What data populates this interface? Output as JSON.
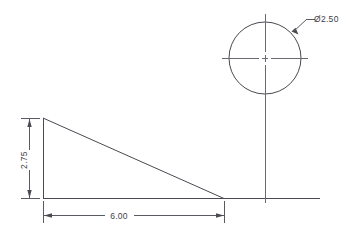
{
  "drawing": {
    "background_color": "#ffffff",
    "line_color": "#4a4a52",
    "dim_color": "#5a5a62",
    "center_color": "#6a6a72",
    "title": "Engineering part drawing",
    "views": {
      "profile": {
        "name": "Right triangle wedge profile",
        "shape": "right-triangle",
        "vertices_label": "apex-top-left, bottom-left, bottom-right"
      },
      "hole": {
        "name": "Circular hole view",
        "shape": "circle"
      }
    },
    "dimensions": [
      {
        "id": "height",
        "value": "2.75",
        "orientation": "vertical",
        "placement": "left"
      },
      {
        "id": "length",
        "value": "6.00",
        "orientation": "horizontal",
        "placement": "bottom"
      },
      {
        "id": "diameter",
        "value": "Ø2.50",
        "orientation": "leader",
        "placement": "upper-right",
        "symbol": "diameter-symbol"
      }
    ]
  }
}
